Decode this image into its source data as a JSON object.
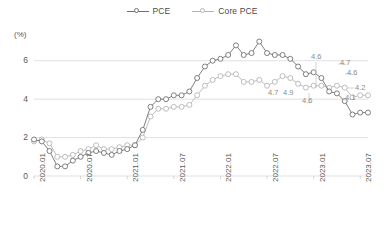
{
  "legend": {
    "items": [
      {
        "label": "PCE",
        "color": "#707070",
        "icon": "circle-marker-line-icon"
      },
      {
        "label": "Core PCE",
        "color": "#b5b5b5",
        "icon": "circle-marker-line-icon"
      }
    ]
  },
  "axis": {
    "unit": "(%)",
    "yticks": [
      "6",
      "4",
      "2",
      "0"
    ],
    "xticks": [
      "2020.01",
      "2020.07",
      "2021.01",
      "2021.07",
      "2022.01",
      "2022.07",
      "2023.01",
      "2023.07"
    ]
  },
  "annotations": [
    {
      "text": "4.7",
      "x": 268,
      "y": 88
    },
    {
      "text": "4.9",
      "x": 283,
      "y": 88
    },
    {
      "text": "4.6",
      "x": 302,
      "y": 96
    },
    {
      "text": "4.6",
      "x": 311,
      "y": 52
    },
    {
      "text": "4.7",
      "x": 340,
      "y": 58
    },
    {
      "text": "4.6",
      "x": 347,
      "y": 68
    },
    {
      "text": "4.2",
      "x": 355,
      "y": 83
    },
    {
      "text": "4.1",
      "x": 345,
      "y": 93
    }
  ],
  "chart_data": {
    "type": "line",
    "title": "",
    "xlabel": "",
    "ylabel": "(%)",
    "ylim": [
      0,
      7.6
    ],
    "grid": "horizontal",
    "legend_position": "top-center",
    "x": [
      "2020.01",
      "2020.02",
      "2020.03",
      "2020.04",
      "2020.05",
      "2020.06",
      "2020.07",
      "2020.08",
      "2020.09",
      "2020.10",
      "2020.11",
      "2020.12",
      "2021.01",
      "2021.02",
      "2021.03",
      "2021.04",
      "2021.05",
      "2021.06",
      "2021.07",
      "2021.08",
      "2021.09",
      "2021.10",
      "2021.11",
      "2021.12",
      "2022.01",
      "2022.02",
      "2022.03",
      "2022.04",
      "2022.05",
      "2022.06",
      "2022.07",
      "2022.08",
      "2022.09",
      "2022.10",
      "2022.11",
      "2022.12",
      "2023.01",
      "2023.02",
      "2023.03",
      "2023.04",
      "2023.05",
      "2023.06",
      "2023.07",
      "2023.08"
    ],
    "series": [
      {
        "name": "PCE",
        "color": "#707070",
        "values": [
          1.9,
          1.8,
          1.3,
          0.5,
          0.5,
          0.8,
          1.0,
          1.2,
          1.3,
          1.2,
          1.1,
          1.3,
          1.4,
          1.6,
          2.4,
          3.6,
          4.0,
          4.0,
          4.2,
          4.2,
          4.4,
          5.1,
          5.7,
          6.0,
          6.1,
          6.3,
          6.8,
          6.3,
          6.4,
          7.0,
          6.4,
          6.3,
          6.3,
          6.1,
          5.7,
          5.3,
          5.4,
          5.1,
          4.4,
          4.3,
          3.9,
          3.2,
          3.3,
          3.3
        ]
      },
      {
        "name": "Core PCE",
        "color": "#b5b5b5",
        "values": [
          1.8,
          1.9,
          1.7,
          1.0,
          1.0,
          1.1,
          1.3,
          1.4,
          1.6,
          1.4,
          1.4,
          1.5,
          1.6,
          1.6,
          2.0,
          3.1,
          3.5,
          3.5,
          3.6,
          3.6,
          3.7,
          4.2,
          4.7,
          5.0,
          5.2,
          5.3,
          5.3,
          4.9,
          4.9,
          5.0,
          4.7,
          4.9,
          5.2,
          5.1,
          4.8,
          4.6,
          4.7,
          4.7,
          4.6,
          4.7,
          4.6,
          4.1,
          4.2,
          4.2
        ]
      }
    ]
  },
  "plot": {
    "left": 34,
    "right": 368,
    "top": 30,
    "bottom": 176,
    "y_top_value": 7.6,
    "y_bottom_value": 0
  }
}
